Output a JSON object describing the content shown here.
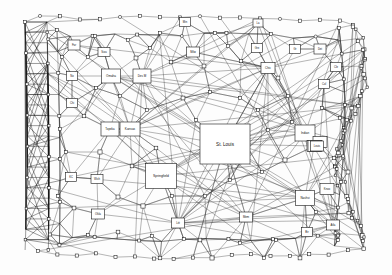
{
  "diagram": {
    "type": "node-link-graph",
    "colors": {
      "background": "#fdfdfd",
      "node_fill": "#ffffff",
      "node_stroke": "#161616",
      "edge": "#2b2b2b",
      "edge_dense": "#111111"
    },
    "labeled_nodes": [
      {
        "id": "stlouis",
        "label": "St. Louis",
        "x": 225,
        "y": 144,
        "w": 50,
        "h": 40,
        "font": 4.6
      },
      {
        "id": "springfield",
        "label": "Springfield",
        "x": 161,
        "y": 176,
        "w": 31,
        "h": 25,
        "font": 3.4
      },
      {
        "id": "kansas",
        "label": "Kansas",
        "x": 130,
        "y": 129,
        "w": 20,
        "h": 14,
        "font": 3.1
      },
      {
        "id": "topeka",
        "label": "Topeka",
        "x": 110,
        "y": 129,
        "w": 18,
        "h": 14,
        "font": 2.9
      },
      {
        "id": "omaha",
        "label": "Omaha",
        "x": 111,
        "y": 76,
        "w": 19,
        "h": 14,
        "font": 3.0
      },
      {
        "id": "desmoines",
        "label": "Des M",
        "x": 142,
        "y": 76,
        "w": 18,
        "h": 14,
        "font": 3.0
      },
      {
        "id": "chicago",
        "label": "Chic",
        "x": 268,
        "y": 68,
        "w": 14,
        "h": 11,
        "font": 2.9
      },
      {
        "id": "milwaukee",
        "label": "Milw",
        "x": 193,
        "y": 52,
        "w": 13,
        "h": 10,
        "font": 2.8
      },
      {
        "id": "fargo",
        "label": "Far",
        "x": 74,
        "y": 45,
        "w": 12,
        "h": 10,
        "font": 2.8
      },
      {
        "id": "siouxfalls",
        "label": "Siou",
        "x": 104,
        "y": 52,
        "w": 12,
        "h": 9,
        "font": 2.7
      },
      {
        "id": "norfolkne",
        "label": "No",
        "x": 72,
        "y": 76,
        "w": 11,
        "h": 9,
        "font": 2.7
      },
      {
        "id": "wichita",
        "label": "Chi",
        "x": 72,
        "y": 103,
        "w": 11,
        "h": 9,
        "font": 2.7
      },
      {
        "id": "kc2",
        "label": "KC",
        "x": 71,
        "y": 177,
        "w": 11,
        "h": 9,
        "font": 2.7
      },
      {
        "id": "wichita2",
        "label": "Wich",
        "x": 97,
        "y": 179,
        "w": 12,
        "h": 9,
        "font": 2.7
      },
      {
        "id": "oklahoma",
        "label": "Okla",
        "x": 98,
        "y": 214,
        "w": 13,
        "h": 10,
        "font": 2.8
      },
      {
        "id": "littlerock",
        "label": "Litt",
        "x": 178,
        "y": 223,
        "w": 13,
        "h": 10,
        "font": 2.8
      },
      {
        "id": "memphis",
        "label": "Mem",
        "x": 246,
        "y": 217,
        "w": 13,
        "h": 10,
        "font": 2.8
      },
      {
        "id": "nashville",
        "label": "Nashvi",
        "x": 305,
        "y": 198,
        "w": 19,
        "h": 15,
        "font": 3.0
      },
      {
        "id": "knoxville",
        "label": "Knox",
        "x": 327,
        "y": 189,
        "w": 14,
        "h": 11,
        "font": 2.8
      },
      {
        "id": "atlanta",
        "label": "Atla",
        "x": 333,
        "y": 225,
        "w": 13,
        "h": 10,
        "font": 2.8
      },
      {
        "id": "birmingham",
        "label": "Bir",
        "x": 307,
        "y": 232,
        "w": 11,
        "h": 9,
        "font": 2.7
      },
      {
        "id": "indianapolis",
        "label": "Indian",
        "x": 305,
        "y": 133,
        "w": 20,
        "h": 16,
        "font": 3.0
      },
      {
        "id": "cincinnati",
        "label": "Cinc",
        "x": 320,
        "y": 142,
        "w": 14,
        "h": 11,
        "font": 2.8
      },
      {
        "id": "louisville",
        "label": "Louis",
        "x": 314,
        "y": 146,
        "w": 14,
        "h": 11,
        "font": 2.8
      },
      {
        "id": "louisville2",
        "label": "Louis",
        "x": 315,
        "y": 146,
        "w": 14,
        "h": 11,
        "font": 2.8
      },
      {
        "id": "detroit",
        "label": "Det",
        "x": 320,
        "y": 49,
        "w": 12,
        "h": 10,
        "font": 2.7
      },
      {
        "id": "clevel",
        "label": "Cle",
        "x": 336,
        "y": 67,
        "w": 11,
        "h": 9,
        "font": 2.7
      },
      {
        "id": "columbus",
        "label": "Col",
        "x": 324,
        "y": 84,
        "w": 11,
        "h": 9,
        "font": 2.7
      },
      {
        "id": "grandrap",
        "label": "Gr",
        "x": 295,
        "y": 49,
        "w": 11,
        "h": 9,
        "font": 2.7
      },
      {
        "id": "lansing",
        "label": "La",
        "x": 258,
        "y": 23,
        "w": 10,
        "h": 8,
        "font": 2.6
      },
      {
        "id": "greenbay",
        "label": "Gre",
        "x": 257,
        "y": 48,
        "w": 11,
        "h": 9,
        "font": 2.7
      },
      {
        "id": "stpaul",
        "label": "Min",
        "x": 185,
        "y": 22,
        "w": 11,
        "h": 9,
        "font": 2.7
      },
      {
        "id": "louis_r",
        "label": "Louis",
        "x": 317,
        "y": 146,
        "w": 13,
        "h": 10,
        "font": 2.7
      }
    ],
    "unlabeled_node_count": 168,
    "edge_count": 520
  }
}
